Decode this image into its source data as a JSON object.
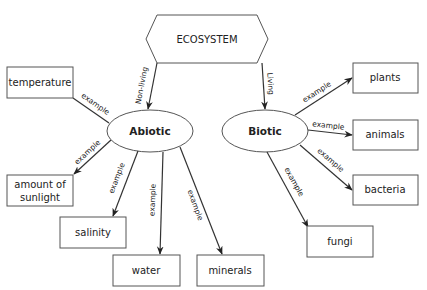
{
  "diagram": {
    "root": {
      "label": "ECOSYSTEM",
      "shape": "hexagon"
    },
    "categories": [
      {
        "id": "abiotic",
        "label": "Abiotic",
        "edge_label": "Non-living"
      },
      {
        "id": "biotic",
        "label": "Biotic",
        "edge_label": "Living"
      }
    ],
    "abiotic_examples": [
      {
        "label": "temperature",
        "edge_label": "example"
      },
      {
        "label_line1": "amount of",
        "label_line2": "sunlight",
        "edge_label": "example"
      },
      {
        "label": "salinity",
        "edge_label": "example"
      },
      {
        "label": "water",
        "edge_label": "example"
      },
      {
        "label": "minerals",
        "edge_label": "example"
      }
    ],
    "biotic_examples": [
      {
        "label": "plants",
        "edge_label": "example"
      },
      {
        "label": "animals",
        "edge_label": "example"
      },
      {
        "label": "bacteria",
        "edge_label": "example"
      },
      {
        "label": "fungi",
        "edge_label": "example"
      }
    ],
    "colors": {
      "stroke": "#555555",
      "edge": "#333333",
      "text": "#222222",
      "background": "#ffffff"
    }
  }
}
